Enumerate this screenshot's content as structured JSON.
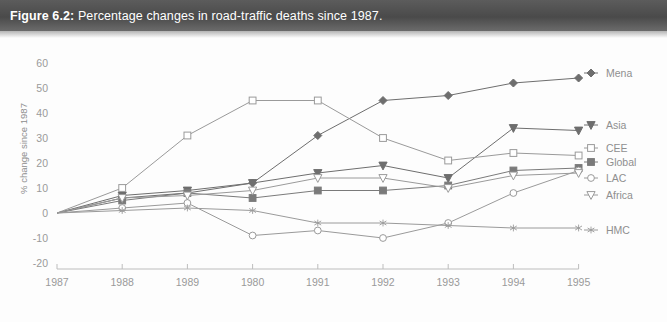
{
  "figure": {
    "number": "Figure 6.2:",
    "caption": "Percentage changes in road-traffic deaths since 1987."
  },
  "chart_data": {
    "type": "line",
    "title": "Percentage changes in road-traffic deaths since 1987.",
    "xlabel": "",
    "ylabel": "% change since 1987",
    "categories": [
      "1987",
      "1988",
      "1989",
      "1980",
      "1991",
      "1992",
      "1993",
      "1994",
      "1995"
    ],
    "x_tick_labels": [
      "1987",
      "1988",
      "1989",
      "1980",
      "1991",
      "1992",
      "1993",
      "1994",
      "1995"
    ],
    "y_tick_labels": [
      "60",
      "50",
      "40",
      "30",
      "20",
      "10",
      "0",
      "-10",
      "-20"
    ],
    "y_ticks": [
      60,
      50,
      40,
      30,
      20,
      10,
      0,
      -10,
      -20
    ],
    "ylim": [
      -20,
      60
    ],
    "grid": false,
    "legend_position": "right",
    "series": [
      {
        "name": "Mena",
        "marker": "filled-diamond",
        "color": "#6e6e6e",
        "values": [
          0,
          6,
          8,
          12,
          31,
          45,
          47,
          52,
          54
        ]
      },
      {
        "name": "Asia",
        "marker": "filled-triangle-down",
        "color": "#6e6e6e",
        "values": [
          0,
          7,
          9,
          12,
          16,
          19,
          14,
          34,
          33
        ]
      },
      {
        "name": "CEE",
        "marker": "open-square",
        "color": "#9a9a9a",
        "values": [
          0,
          10,
          31,
          45,
          45,
          30,
          21,
          24,
          23
        ]
      },
      {
        "name": "Global",
        "marker": "filled-square",
        "color": "#7a7a7a",
        "values": [
          0,
          5,
          8,
          6,
          9,
          9,
          11,
          17,
          18
        ]
      },
      {
        "name": "LAC",
        "marker": "open-circle",
        "color": "#9a9a9a",
        "values": [
          0,
          2,
          4,
          -9,
          -7,
          -10,
          -4,
          8,
          17
        ]
      },
      {
        "name": "Africa",
        "marker": "open-triangle-down",
        "color": "#9a9a9a",
        "values": [
          0,
          6,
          7,
          9,
          14,
          14,
          10,
          15,
          16
        ]
      },
      {
        "name": "HMC",
        "marker": "asterisk",
        "color": "#9a9a9a",
        "values": [
          0,
          1,
          2,
          1,
          -4,
          -4,
          -5,
          -6,
          -6
        ]
      }
    ]
  },
  "legend": {
    "items": [
      {
        "label": "Mena"
      },
      {
        "label": "Asia"
      },
      {
        "label": "CEE"
      },
      {
        "label": "Global"
      },
      {
        "label": "LAC"
      },
      {
        "label": "Africa"
      },
      {
        "label": "HMC"
      }
    ]
  }
}
